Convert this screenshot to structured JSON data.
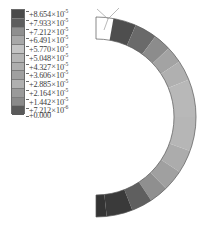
{
  "figure": {
    "type": "fea-contour-plot"
  },
  "legend": {
    "name": "contour-legend",
    "band_count": 12,
    "multiply_symbol": "×",
    "entries": [
      {
        "mantissa": "+8.654",
        "exponent": "-5",
        "swatch_color": "#4a4a4a"
      },
      {
        "mantissa": "+7.933",
        "exponent": "-5",
        "swatch_color": "#5e5e5e"
      },
      {
        "mantissa": "+7.212",
        "exponent": "-5",
        "swatch_color": "#8f8f8f"
      },
      {
        "mantissa": "+6.491",
        "exponent": "-5",
        "swatch_color": "#a8a8a8"
      },
      {
        "mantissa": "+5.770",
        "exponent": "-5",
        "swatch_color": "#c4c4c4"
      },
      {
        "mantissa": "+5.048",
        "exponent": "-5",
        "swatch_color": "#b5b5b5"
      },
      {
        "mantissa": "+4.327",
        "exponent": "-5",
        "swatch_color": "#aeaeae"
      },
      {
        "mantissa": "+3.606",
        "exponent": "-5",
        "swatch_color": "#a0a0a0"
      },
      {
        "mantissa": "+2.885",
        "exponent": "-5",
        "swatch_color": "#b0b0b0"
      },
      {
        "mantissa": "+2.164",
        "exponent": "-5",
        "swatch_color": "#9a9a9a"
      },
      {
        "mantissa": "+1.442",
        "exponent": "-5",
        "swatch_color": "#8a8a8a"
      },
      {
        "mantissa": "+7.212",
        "exponent": "-6",
        "swatch_color": "#5a5a5a"
      },
      {
        "mantissa": "+0.000",
        "exponent": "",
        "swatch_color": null
      }
    ]
  },
  "chart_data": {
    "type": "heatmap",
    "title": "",
    "xlabel": "",
    "ylabel": "",
    "geometry": "C-shaped annular sector, opening toward the left",
    "angular_range_deg": [
      -80,
      80
    ],
    "colormap": "grayscale-banded",
    "legend_position": "left",
    "grid": false,
    "scale_values": [
      8.654e-05,
      7.933e-05,
      7.212e-05,
      6.491e-05,
      5.77e-05,
      5.048e-05,
      4.327e-05,
      3.606e-05,
      2.885e-05,
      2.164e-05,
      1.442e-05,
      7.212e-06,
      0.0
    ],
    "bands": [
      {
        "name": "top-outer-end",
        "position_deg": -80,
        "level": 8.654e-05,
        "fill": "#5a5a5a"
      },
      {
        "name": "top-band-2",
        "position_deg": -66,
        "level": 7.933e-05,
        "fill": "#6b6b6b"
      },
      {
        "name": "top-band-3",
        "position_deg": -52,
        "level": 7.212e-05,
        "fill": "#8d8d8d"
      },
      {
        "name": "top-band-4",
        "position_deg": -38,
        "level": 6.491e-05,
        "fill": "#a4a4a4"
      },
      {
        "name": "upper-mid-band",
        "position_deg": -22,
        "level": 5.77e-05,
        "fill": "#b4b4b4"
      },
      {
        "name": "right-apex-band",
        "position_deg": 0,
        "level": 5.048e-05,
        "fill": "#b9b9b9"
      },
      {
        "name": "lower-mid-band",
        "position_deg": 22,
        "level": 4.327e-05,
        "fill": "#b4b4b4"
      },
      {
        "name": "bottom-band-4",
        "position_deg": 40,
        "level": 3.606e-05,
        "fill": "#a8a8a8"
      },
      {
        "name": "bottom-band-3",
        "position_deg": 55,
        "level": 2.164e-05,
        "fill": "#9a9a9a"
      },
      {
        "name": "bottom-band-2",
        "position_deg": 67,
        "level": 1.442e-05,
        "fill": "#6d6d6d"
      },
      {
        "name": "bottom-outer-end",
        "position_deg": 80,
        "level": 7.212e-06,
        "fill": "#3a3a3a"
      }
    ]
  },
  "axis_triad": {
    "name": "orientation-triad",
    "visible": true
  }
}
